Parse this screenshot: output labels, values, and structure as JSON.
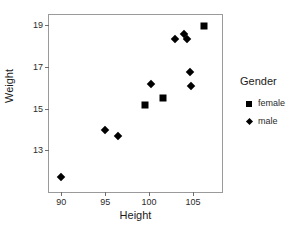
{
  "chart_data": {
    "type": "scatter",
    "title": "",
    "xlabel": "Height",
    "ylabel": "Weight",
    "xlim": [
      88.6,
      108.3
    ],
    "ylim": [
      11.0,
      19.5
    ],
    "xticks": [
      90,
      95,
      100,
      105
    ],
    "yticks": [
      13,
      15,
      17,
      19
    ],
    "xtick_labels": [
      "90",
      "95",
      "100",
      "105"
    ],
    "ytick_labels": [
      "13",
      "15",
      "17",
      "19"
    ],
    "grid": false,
    "legend_position": "right",
    "legend_title": "Gender",
    "series": [
      {
        "name": "female",
        "marker": "square",
        "color": "#000000",
        "points": [
          {
            "x": 99.5,
            "y": 15.2
          },
          {
            "x": 101.6,
            "y": 15.5
          },
          {
            "x": 106.3,
            "y": 18.95
          }
        ]
      },
      {
        "name": "male",
        "marker": "diamond",
        "color": "#000000",
        "points": [
          {
            "x": 90.0,
            "y": 11.7
          },
          {
            "x": 95.0,
            "y": 14.0
          },
          {
            "x": 96.4,
            "y": 13.7
          },
          {
            "x": 100.2,
            "y": 16.2
          },
          {
            "x": 102.9,
            "y": 18.35
          },
          {
            "x": 104.0,
            "y": 18.6
          },
          {
            "x": 104.3,
            "y": 18.35
          },
          {
            "x": 104.7,
            "y": 16.75
          },
          {
            "x": 104.8,
            "y": 16.1
          }
        ]
      }
    ]
  },
  "axes": {
    "x_title": "Height",
    "y_title": "Weight"
  },
  "legend": {
    "title": "Gender",
    "entries": [
      {
        "label": "female",
        "marker": "square"
      },
      {
        "label": "male",
        "marker": "diamond"
      }
    ]
  }
}
